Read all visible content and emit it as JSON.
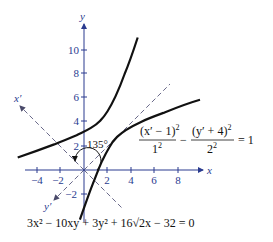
{
  "figure": {
    "type": "rotated-hyperbola-diagram",
    "colors": {
      "axis": "#2a3b8f",
      "curve": "#111111",
      "rotated_axis": "#6a6a8a",
      "text": "#111111"
    },
    "axes": {
      "x_label": "x",
      "y_label": "y",
      "x_prime_label": "x′",
      "y_prime_label": "y′",
      "x_ticks": [
        "−4",
        "−2",
        "2",
        "4",
        "6",
        "8"
      ],
      "y_ticks": [
        "−2",
        "2",
        "4",
        "6",
        "8",
        "10"
      ]
    },
    "angle_label": "135°",
    "standard_equation": {
      "num1": "(x′ − 1)",
      "num1_exp": "2",
      "den1": "1",
      "den1_exp": "2",
      "minus": "−",
      "num2": "(y′ + 4)",
      "num2_exp": "2",
      "den2": "2",
      "den2_exp": "2",
      "rhs": "= 1"
    },
    "general_equation": "3x² − 10xy + 3y² + 16√2x − 32 = 0"
  }
}
